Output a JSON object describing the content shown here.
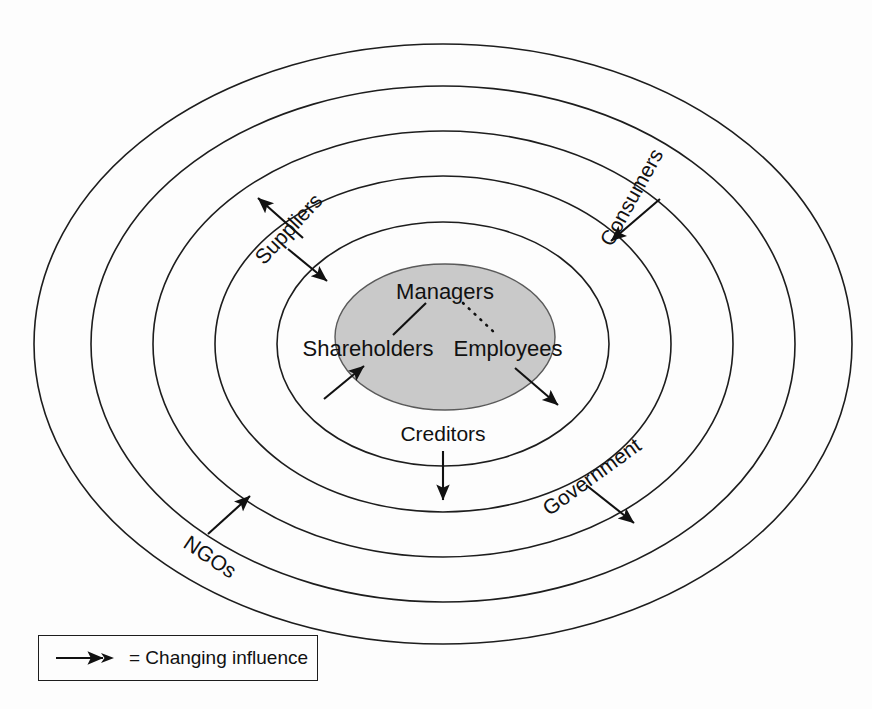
{
  "diagram": {
    "type": "concentric-stakeholder-ellipses",
    "core": {
      "label_top": "Managers",
      "label_left": "Shareholders",
      "label_right": "Employees",
      "fill_color": "#c9c9c9",
      "links": [
        {
          "from": "Managers",
          "to": "Shareholders",
          "style": "solid"
        },
        {
          "from": "Managers",
          "to": "Employees",
          "style": "dotted"
        }
      ]
    },
    "ring_labels": [
      {
        "name": "Suppliers",
        "text": "Suppliers",
        "orientation": "rotated",
        "arrows": [
          "outward",
          "inward"
        ]
      },
      {
        "name": "Consumers",
        "text": "Consumers",
        "orientation": "rotated",
        "arrows": [
          "inward"
        ]
      },
      {
        "name": "Creditors",
        "text": "Creditors",
        "orientation": "horizontal",
        "arrows": [
          "outward"
        ]
      },
      {
        "name": "Government",
        "text": "Government",
        "orientation": "rotated",
        "arrows": [
          "outward"
        ]
      },
      {
        "name": "NGOs",
        "text": "NGOs",
        "orientation": "rotated",
        "arrows": [
          "inward"
        ]
      },
      {
        "name": "Shareholders",
        "text": "Shareholders",
        "orientation": "horizontal",
        "arrows": [
          "inward"
        ]
      },
      {
        "name": "Employees",
        "text": "Employees",
        "orientation": "horizontal",
        "arrows": [
          "outward"
        ]
      }
    ],
    "ring_count": 5,
    "stroke_color": "#1d1d1d"
  },
  "legend": {
    "symbol": "arrow-right-icon",
    "text": "= Changing influence"
  }
}
